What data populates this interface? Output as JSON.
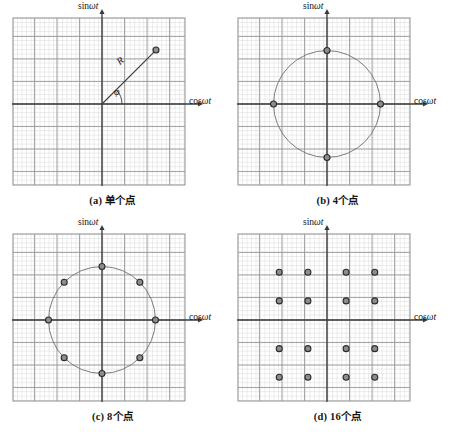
{
  "figure": {
    "background_color": "#ffffff",
    "panel_count": 4
  },
  "axes": {
    "y_label_prefix": "sin",
    "y_label_var": "ωt",
    "x_label_prefix": "cos",
    "x_label_var": "ωt",
    "y_label_full": "sinωt",
    "x_label_full": "cosωt"
  },
  "annotations": {
    "radius_label": "R",
    "phase_label": "φ"
  },
  "style": {
    "minor_grid_color": "#d9d9d9",
    "major_grid_color": "#9a9a9a",
    "axis_color": "#3a3a3a",
    "circle_color": "#6d6d6d",
    "marker_fill": "#8d8d8d",
    "marker_stroke": "#2b2b2b",
    "vector_color": "#3d3d3d",
    "text_color": "#141414"
  },
  "panels": [
    {
      "id": "a",
      "caption": "(a) 单个点",
      "point_count": 1,
      "has_circle": false,
      "has_vector": true,
      "chart_data": {
        "type": "scatter",
        "title": "(a) 单个点",
        "xlabel": "cosωt",
        "ylabel": "sinωt",
        "xlim": [
          -9,
          9
        ],
        "ylim": [
          -9,
          9
        ],
        "grid": true,
        "minor_step": 1,
        "major_step": 5,
        "points": [
          {
            "x": 5.65,
            "y": 5.65,
            "angle_deg": 45,
            "radius": 8.0
          }
        ],
        "annotations": [
          {
            "text": "R",
            "kind": "vector-magnitude"
          },
          {
            "text": "φ",
            "kind": "phase-angle"
          }
        ]
      }
    },
    {
      "id": "b",
      "caption": "(b) 4个点",
      "point_count": 4,
      "has_circle": true,
      "has_vector": false,
      "chart_data": {
        "type": "scatter",
        "title": "(b) 4个点",
        "xlabel": "cosωt",
        "ylabel": "sinωt",
        "xlim": [
          -9,
          9
        ],
        "ylim": [
          -9,
          9
        ],
        "grid": true,
        "minor_step": 1,
        "major_step": 5,
        "circle_radius": 5.6,
        "points": [
          {
            "x": 5.6,
            "y": 0,
            "angle_deg": 0,
            "radius": 5.6
          },
          {
            "x": 0,
            "y": 5.6,
            "angle_deg": 90,
            "radius": 5.6
          },
          {
            "x": -5.6,
            "y": 0,
            "angle_deg": 180,
            "radius": 5.6
          },
          {
            "x": 0,
            "y": -5.6,
            "angle_deg": 270,
            "radius": 5.6
          }
        ]
      }
    },
    {
      "id": "c",
      "caption": "(c) 8个点",
      "point_count": 8,
      "has_circle": true,
      "has_vector": false,
      "chart_data": {
        "type": "scatter",
        "title": "(c) 8个点",
        "xlabel": "cosωt",
        "ylabel": "sinωt",
        "xlim": [
          -9,
          9
        ],
        "ylim": [
          -9,
          9
        ],
        "grid": true,
        "minor_step": 1,
        "major_step": 5,
        "circle_radius": 5.6,
        "points": [
          {
            "x": 5.6,
            "y": 0,
            "angle_deg": 0,
            "radius": 5.6
          },
          {
            "x": 3.96,
            "y": 3.96,
            "angle_deg": 45,
            "radius": 5.6
          },
          {
            "x": 0,
            "y": 5.6,
            "angle_deg": 90,
            "radius": 5.6
          },
          {
            "x": -3.96,
            "y": 3.96,
            "angle_deg": 135,
            "radius": 5.6
          },
          {
            "x": -5.6,
            "y": 0,
            "angle_deg": 180,
            "radius": 5.6
          },
          {
            "x": -3.96,
            "y": -3.96,
            "angle_deg": 225,
            "radius": 5.6
          },
          {
            "x": 0,
            "y": -5.6,
            "angle_deg": 270,
            "radius": 5.6
          },
          {
            "x": 3.96,
            "y": -3.96,
            "angle_deg": 315,
            "radius": 5.6
          }
        ]
      }
    },
    {
      "id": "d",
      "caption": "(d) 16个点",
      "point_count": 16,
      "has_circle": false,
      "has_vector": false,
      "chart_data": {
        "type": "scatter",
        "title": "(d) 16个点",
        "xlabel": "cosωt",
        "ylabel": "sinωt",
        "xlim": [
          -9,
          9
        ],
        "ylim": [
          -9,
          9
        ],
        "grid": true,
        "minor_step": 1,
        "major_step": 5,
        "points": [
          {
            "x": -5,
            "y": 5
          },
          {
            "x": -2,
            "y": 5
          },
          {
            "x": 2,
            "y": 5
          },
          {
            "x": 5,
            "y": 5
          },
          {
            "x": -5,
            "y": 2
          },
          {
            "x": -2,
            "y": 2
          },
          {
            "x": 2,
            "y": 2
          },
          {
            "x": 5,
            "y": 2
          },
          {
            "x": -5,
            "y": -3
          },
          {
            "x": -2,
            "y": -3
          },
          {
            "x": 2,
            "y": -3
          },
          {
            "x": 5,
            "y": -3
          },
          {
            "x": -5,
            "y": -6
          },
          {
            "x": -2,
            "y": -6
          },
          {
            "x": 2,
            "y": -6
          },
          {
            "x": 5,
            "y": -6
          }
        ]
      }
    }
  ]
}
